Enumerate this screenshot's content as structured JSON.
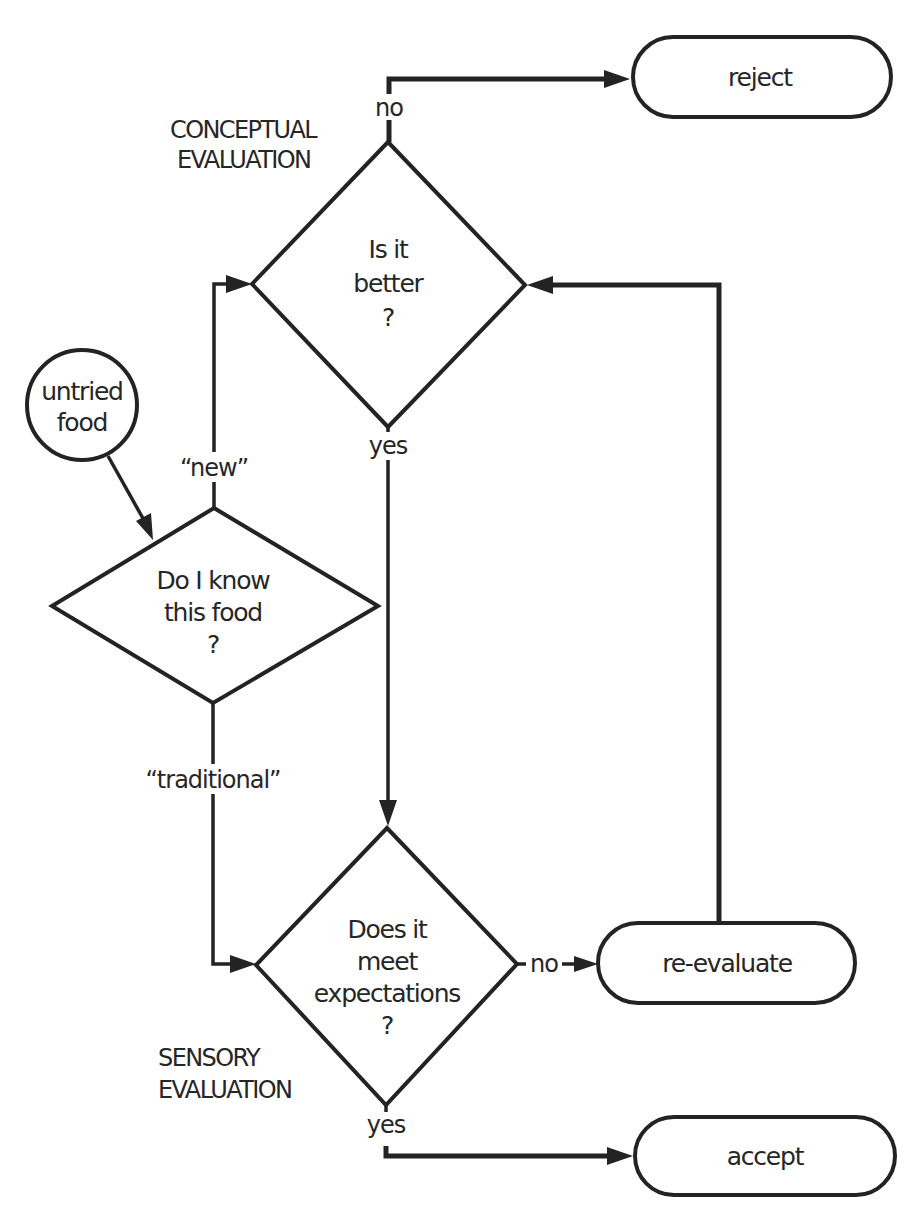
{
  "diagram": {
    "type": "flowchart",
    "nodes": {
      "start": {
        "shape": "circle",
        "lines": [
          "untried",
          "food"
        ]
      },
      "decision_known": {
        "shape": "diamond",
        "lines": [
          "Do I know",
          "this food",
          "?"
        ]
      },
      "decision_better": {
        "shape": "diamond",
        "lines": [
          "Is it",
          "better",
          "?"
        ]
      },
      "decision_expectations": {
        "shape": "diamond",
        "lines": [
          "Does it",
          "meet",
          "expectations",
          "?"
        ]
      },
      "reject": {
        "shape": "terminal",
        "label": "reject"
      },
      "reevaluate": {
        "shape": "terminal",
        "label": "re-evaluate"
      },
      "accept": {
        "shape": "terminal",
        "label": "accept"
      }
    },
    "edge_labels": {
      "new": "“new”",
      "traditional": "“traditional”",
      "better_no": "no",
      "better_yes": "yes",
      "expectations_no": "no",
      "expectations_yes": "yes"
    },
    "sections": {
      "conceptual": [
        "CONCEPTUAL",
        "EVALUATION"
      ],
      "sensory": [
        "SENSORY",
        "EVALUATION"
      ]
    },
    "edges": [
      {
        "from": "untried food",
        "to": "Do I know this food ?",
        "label": ""
      },
      {
        "from": "Do I know this food ?",
        "to": "Is it better ?",
        "label": "“new”"
      },
      {
        "from": "Do I know this food ?",
        "to": "Does it meet expectations ?",
        "label": "“traditional”"
      },
      {
        "from": "Is it better ?",
        "to": "reject",
        "label": "no"
      },
      {
        "from": "Is it better ?",
        "to": "Does it meet expectations ?",
        "label": "yes"
      },
      {
        "from": "Does it meet expectations ?",
        "to": "re-evaluate",
        "label": "no"
      },
      {
        "from": "Does it meet expectations ?",
        "to": "accept",
        "label": "yes"
      },
      {
        "from": "re-evaluate",
        "to": "Is it better ?",
        "label": ""
      }
    ]
  }
}
